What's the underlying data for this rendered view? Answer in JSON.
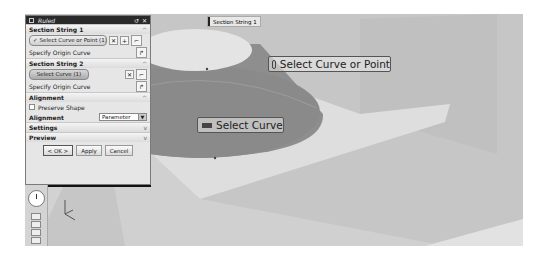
{
  "dialog": {
    "title": "Ruled",
    "title_buttons": [
      "reset-icon",
      "close-icon"
    ],
    "sections": [
      {
        "header": "Section String 1",
        "expanded": true,
        "select_button": "Select Curve or Point (1)",
        "origin_label": "Specify Origin Curve"
      },
      {
        "header": "Section String 2",
        "expanded": true,
        "select_button": "Select Curve (1)",
        "origin_label": "Specify Origin Curve"
      },
      {
        "header": "Alignment",
        "expanded": true,
        "preserve_shape_label": "Preserve Shape",
        "preserve_shape_checked": false,
        "alignment_label": "Alignment",
        "alignment_value": "Parameter"
      },
      {
        "header": "Settings",
        "expanded": false
      },
      {
        "header": "Preview",
        "expanded": false
      }
    ],
    "buttons": {
      "ok": "< OK >",
      "apply": "Apply",
      "cancel": "Cancel"
    }
  },
  "viewport": {
    "selection_tag": "Section String 1",
    "tooltip_top": "Select Curve or Point",
    "tooltip_bottom": "Select Curve",
    "colors": {
      "background": "#c9c9c9",
      "cone_side": "#8c8c8c",
      "cone_top": "#e4e4e4",
      "plane": "#dedede"
    }
  }
}
